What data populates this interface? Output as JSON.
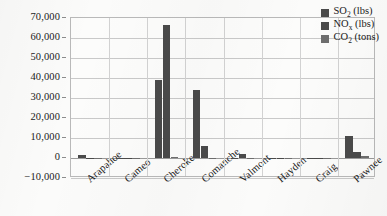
{
  "chart_data": {
    "type": "bar",
    "title": "",
    "xlabel": "",
    "ylabel": "",
    "ylim": [
      -10000,
      70000
    ],
    "ytick_step": 10000,
    "grid": true,
    "legend_position": "top-right-inside",
    "orientation": "vertical-grouped",
    "categories": [
      "Arapahoe",
      "Cameo",
      "Cherokee",
      "Comanche",
      "Valmont",
      "Hayden",
      "Craig",
      "Pawnee"
    ],
    "ytick_labels": [
      "70,000",
      "60,000",
      "50,000",
      "40,000",
      "30,000",
      "20,000",
      "10,000",
      "0",
      "−10,000"
    ],
    "ytick_values": [
      70000,
      60000,
      50000,
      40000,
      30000,
      20000,
      10000,
      0,
      -10000
    ],
    "series": [
      {
        "name": "SO₂ (lbs)",
        "name_base": "SO",
        "name_sub": "2",
        "name_unit": "(lbs)",
        "color": "#4a4a4a",
        "values": [
          1500,
          150,
          38800,
          34100,
          250,
          200,
          120,
          10800
        ]
      },
      {
        "name": "NOₓ (lbs)",
        "name_base": "NO",
        "name_sub": "x",
        "name_unit": "(lbs)",
        "color": "#4a4a4a",
        "values": [
          200,
          120,
          66400,
          6200,
          2000,
          150,
          100,
          2900
        ]
      },
      {
        "name": "CO₂ (tons)",
        "name_base": "CO",
        "name_sub": "2",
        "name_unit": "(tons)",
        "color": "#6e6e6e",
        "values": [
          -150,
          -200,
          700,
          -600,
          -150,
          -250,
          -120,
          900
        ]
      }
    ]
  },
  "style": {
    "plot_background": "#fcfcfb",
    "page_background": "#fbfbfa",
    "gridline_color": "#c9c9c9",
    "zero_line_color": "#9a9a9a",
    "axis_border_color": "#b9b9b9",
    "text_color": "#1a1a1a"
  }
}
